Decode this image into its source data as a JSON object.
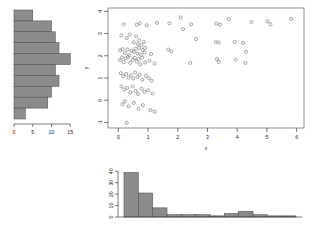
{
  "figure": {
    "background": "#ffffff",
    "point_color": "#6e6e6e",
    "bar_fill": "#8c8c8c",
    "bar_stroke": "#4d4d4d",
    "axis_color": "#2b2b2b"
  },
  "chart_data": [
    {
      "type": "bar",
      "name": "y-marginal-histogram",
      "orientation": "horizontal",
      "title": "",
      "xlabel": "",
      "ylabel": "",
      "xlim": [
        0,
        16
      ],
      "ylim": [
        -1,
        4
      ],
      "xticks": [
        0,
        5,
        10,
        15
      ],
      "xtick_labels": [
        "0",
        "5",
        "10",
        "15"
      ],
      "grid": false,
      "bin_edges": [
        -1.0,
        -0.5,
        0.0,
        0.5,
        1.0,
        1.5,
        2.0,
        2.5,
        3.0,
        3.5,
        4.0
      ],
      "categories": [
        "3.5-4.0",
        "3.0-3.5",
        "2.5-3.0",
        "2.0-2.5",
        "1.5-2.0",
        "1.0-1.5",
        "0.5-1.0",
        "0.0-0.5",
        "-0.5-0.0",
        "-1.0--0.5"
      ],
      "values": [
        5,
        10,
        11,
        12,
        15,
        11,
        12,
        10,
        9,
        3
      ]
    },
    {
      "type": "scatter",
      "name": "main-scatter",
      "title": "",
      "xlabel": "x",
      "ylabel": "y",
      "xlim": [
        -0.35,
        6.25
      ],
      "ylim": [
        -1.25,
        4.15
      ],
      "xticks": [
        0,
        1,
        2,
        3,
        4,
        5,
        6
      ],
      "xtick_labels": [
        "0",
        "1",
        "2",
        "3",
        "4",
        "5",
        "6"
      ],
      "yticks": [
        -1,
        0,
        1,
        2,
        3,
        4
      ],
      "ytick_labels": [
        "-1",
        "0",
        "1",
        "2",
        "3",
        "4"
      ],
      "grid": false,
      "marker": "open-circle",
      "n_points": 100,
      "points": [
        [
          0.18,
          3.42
        ],
        [
          0.62,
          3.4
        ],
        [
          0.72,
          3.45
        ],
        [
          0.95,
          3.37
        ],
        [
          1.3,
          3.48
        ],
        [
          1.72,
          3.46
        ],
        [
          2.1,
          3.72
        ],
        [
          2.18,
          3.2
        ],
        [
          2.45,
          3.42
        ],
        [
          3.3,
          3.45
        ],
        [
          3.42,
          3.4
        ],
        [
          3.72,
          3.65
        ],
        [
          4.48,
          3.52
        ],
        [
          5.02,
          3.55
        ],
        [
          5.12,
          3.42
        ],
        [
          5.82,
          3.66
        ],
        [
          0.1,
          2.92
        ],
        [
          0.28,
          2.8
        ],
        [
          0.38,
          2.95
        ],
        [
          0.52,
          2.6
        ],
        [
          0.6,
          2.88
        ],
        [
          0.66,
          2.52
        ],
        [
          0.7,
          2.7
        ],
        [
          0.78,
          2.48
        ],
        [
          0.86,
          2.62
        ],
        [
          0.9,
          2.35
        ],
        [
          2.62,
          2.75
        ],
        [
          3.28,
          2.62
        ],
        [
          3.38,
          2.6
        ],
        [
          3.92,
          2.62
        ],
        [
          4.2,
          2.58
        ],
        [
          0.06,
          2.25
        ],
        [
          0.14,
          2.3
        ],
        [
          0.22,
          2.12
        ],
        [
          0.3,
          2.28
        ],
        [
          0.36,
          2.02
        ],
        [
          0.44,
          2.22
        ],
        [
          0.52,
          2.18
        ],
        [
          0.58,
          2.32
        ],
        [
          0.64,
          2.1
        ],
        [
          0.7,
          2.35
        ],
        [
          0.76,
          2.05
        ],
        [
          0.82,
          2.26
        ],
        [
          0.88,
          2.14
        ],
        [
          1.1,
          2.08
        ],
        [
          1.68,
          2.28
        ],
        [
          1.78,
          2.2
        ],
        [
          4.3,
          2.18
        ],
        [
          0.05,
          1.8
        ],
        [
          0.12,
          1.92
        ],
        [
          0.18,
          1.72
        ],
        [
          0.24,
          1.88
        ],
        [
          0.32,
          1.95
        ],
        [
          0.4,
          1.68
        ],
        [
          0.48,
          1.82
        ],
        [
          0.55,
          1.9
        ],
        [
          0.62,
          1.74
        ],
        [
          0.68,
          1.86
        ],
        [
          0.74,
          1.62
        ],
        [
          0.8,
          1.92
        ],
        [
          0.9,
          1.7
        ],
        [
          1.05,
          1.78
        ],
        [
          1.22,
          1.65
        ],
        [
          2.42,
          1.68
        ],
        [
          3.32,
          1.85
        ],
        [
          3.38,
          1.72
        ],
        [
          3.95,
          1.82
        ],
        [
          4.28,
          1.68
        ],
        [
          0.08,
          1.22
        ],
        [
          0.16,
          1.08
        ],
        [
          0.26,
          1.18
        ],
        [
          0.34,
          1.02
        ],
        [
          0.42,
          1.12
        ],
        [
          0.5,
          0.98
        ],
        [
          0.56,
          1.25
        ],
        [
          0.64,
          1.05
        ],
        [
          0.72,
          1.15
        ],
        [
          0.8,
          0.92
        ],
        [
          0.92,
          1.1
        ],
        [
          1.02,
          1.0
        ],
        [
          1.12,
          0.88
        ],
        [
          0.1,
          0.62
        ],
        [
          0.2,
          0.48
        ],
        [
          0.3,
          0.55
        ],
        [
          0.4,
          0.35
        ],
        [
          0.48,
          0.62
        ],
        [
          0.58,
          0.42
        ],
        [
          0.66,
          0.28
        ],
        [
          0.78,
          0.52
        ],
        [
          0.88,
          0.38
        ],
        [
          1.0,
          0.45
        ],
        [
          1.15,
          0.3
        ],
        [
          0.14,
          -0.18
        ],
        [
          0.22,
          -0.05
        ],
        [
          0.34,
          -0.28
        ],
        [
          0.52,
          -0.12
        ],
        [
          0.68,
          -0.38
        ],
        [
          0.82,
          -0.22
        ],
        [
          1.08,
          -0.45
        ],
        [
          1.22,
          -0.52
        ],
        [
          0.28,
          -1.02
        ]
      ]
    },
    {
      "type": "bar",
      "name": "x-marginal-histogram",
      "orientation": "vertical",
      "title": "",
      "xlabel": "",
      "ylabel": "",
      "xlim": [
        0,
        6.5
      ],
      "ylim": [
        0,
        42
      ],
      "yticks": [
        0,
        10,
        20,
        30,
        40
      ],
      "ytick_labels": [
        "0",
        "10",
        "20",
        "30",
        "40"
      ],
      "grid": false,
      "bin_edges": [
        0.0,
        0.5,
        1.0,
        1.5,
        2.0,
        2.5,
        3.0,
        3.5,
        4.0,
        4.5,
        5.0,
        5.5,
        6.0
      ],
      "categories": [
        "0.0-0.5",
        "0.5-1.0",
        "1.0-1.5",
        "1.5-2.0",
        "2.0-2.5",
        "2.5-3.0",
        "3.0-3.5",
        "3.5-4.0",
        "4.0-4.5",
        "4.5-5.0",
        "5.0-5.5",
        "5.5-6.0"
      ],
      "values": [
        39,
        21,
        8,
        2,
        2,
        2,
        1,
        3,
        5,
        2,
        1,
        1
      ]
    }
  ]
}
